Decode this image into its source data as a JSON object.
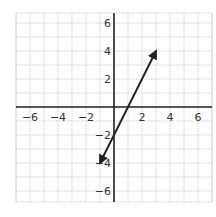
{
  "chart_data": {
    "type": "line",
    "title": "",
    "xlabel": "",
    "ylabel": "",
    "xlim": [
      -6.8,
      7
    ],
    "ylim": [
      -6.8,
      6.8
    ],
    "grid": true,
    "x_ticks": [
      -6,
      -4,
      -2,
      2,
      4,
      6
    ],
    "y_ticks": [
      6,
      4,
      2,
      -2,
      -4,
      -6
    ],
    "x_tick_labels": [
      "−6",
      "−4",
      "−2",
      "2",
      "4",
      "6"
    ],
    "y_tick_labels": [
      "6",
      "4",
      "2",
      "−2",
      "−4",
      "−6"
    ],
    "series": [
      {
        "name": "line",
        "equation": "y = 2x - 2",
        "x": [
          -1,
          3
        ],
        "y": [
          -4,
          4
        ],
        "arrows": "both",
        "color": "#222222"
      }
    ]
  },
  "colors": {
    "grid": "#c8c8c8",
    "axis": "#222222",
    "line": "#222222"
  }
}
